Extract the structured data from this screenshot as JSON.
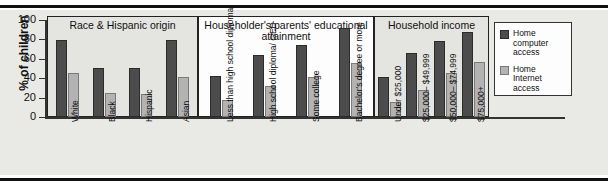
{
  "chart_data": {
    "type": "bar",
    "title": "",
    "xlabel": "",
    "ylabel": "% of children",
    "ylim": [
      0,
      100
    ],
    "yticks": [
      0,
      20,
      40,
      60,
      80,
      100
    ],
    "grid": false,
    "legend_position": "right",
    "legend": [
      "Home computer access",
      "Home Internet access"
    ],
    "panels": [
      {
        "title": "Race & Hispanic origin",
        "categories": [
          "White",
          "Black",
          "Hispanic",
          "Asian"
        ],
        "series": [
          {
            "name": "Home computer access",
            "values": [
              79,
              51,
              51,
              79
            ]
          },
          {
            "name": "Home Internet access",
            "values": [
              45,
              25,
              24,
              41
            ]
          }
        ]
      },
      {
        "title": "Householder's/parents' educational attainment",
        "categories": [
          "Less than high school diploma",
          "High school diploma/ GED",
          "Some college",
          "Bachelor's degree or more"
        ],
        "series": [
          {
            "name": "Home computer access",
            "values": [
              42,
              64,
              74,
              92
            ]
          },
          {
            "name": "Home Internet access",
            "values": [
              18,
              32,
              41,
              56
            ]
          }
        ]
      },
      {
        "title": "Household income",
        "categories": [
          "Under $25,000",
          "$25,000– $49,999",
          "$50,000– $74,999",
          "$75,000+"
        ],
        "series": [
          {
            "name": "Home computer access",
            "values": [
              41,
              66,
              78,
              88
            ]
          },
          {
            "name": "Home Internet access",
            "values": [
              15,
              28,
              45,
              57
            ]
          }
        ]
      }
    ],
    "colors": {
      "dark": "#4c4c4c",
      "light": "#b3b3b3",
      "background": "#e9e9e6"
    }
  },
  "legend": {
    "items": [
      {
        "label": "Home\ncomputer\naccess",
        "swatch": "dark"
      },
      {
        "label": "Home\nInternet\naccess",
        "swatch": "light"
      }
    ]
  }
}
